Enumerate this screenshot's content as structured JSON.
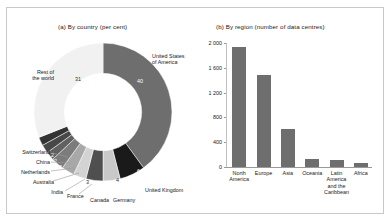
{
  "figure": {
    "background": "#ffffff",
    "border_color": "#c8c8c8"
  },
  "chart_data": [
    {
      "type": "pie",
      "title": "(a) By country (per cent)",
      "unit": "per cent",
      "hole_ratio": 0.56,
      "labels": [
        "United States of America",
        "United Kingdom",
        "Germany",
        "Canada",
        "France",
        "India",
        "Australia",
        "Netherlands",
        "China",
        "Switzerland",
        "Rest of the world"
      ],
      "values": [
        40,
        6,
        4,
        4,
        3,
        3,
        3,
        2,
        2,
        2,
        31
      ],
      "value_labels": [
        "40",
        "6",
        "4",
        "4",
        "3",
        "3",
        "3",
        "2",
        "2",
        "2",
        "31"
      ],
      "colors": [
        "#6e6e6e",
        "#1a1a1a",
        "#c9c9c9",
        "#4f4f4f",
        "#d3d3d3",
        "#a8a8a8",
        "#7c7c7c",
        "#616161",
        "#474747",
        "#333333",
        "#f1f1f1"
      ],
      "legend": "none",
      "grid": false
    },
    {
      "type": "bar",
      "title": "(b) By region (number of data centres)",
      "categories": [
        "North America",
        "Europe",
        "Asia",
        "Oceania",
        "Latin America and the Caribbean",
        "Africa"
      ],
      "category_lines": [
        [
          "North",
          "America"
        ],
        [
          "Europe"
        ],
        [
          "Asia"
        ],
        [
          "Oceania"
        ],
        [
          "Latin",
          "America",
          "and the",
          "Caribbean"
        ],
        [
          "Africa"
        ]
      ],
      "values": [
        1930,
        1490,
        620,
        130,
        110,
        60
      ],
      "xlabel": "",
      "ylabel": "",
      "ylim": [
        0,
        2000
      ],
      "yticks": [
        0,
        400,
        800,
        1200,
        1600,
        2000
      ],
      "ytick_labels": [
        "0",
        "400",
        "800",
        "1 200",
        "1 600",
        "2 000"
      ],
      "bar_color": "#6e6e6e",
      "grid": false,
      "legend": "none"
    }
  ],
  "panel_a": {
    "title": "(a) By country (per cent)",
    "segments": [
      {
        "name": "United States of America",
        "value": "40",
        "label_lines": [
          "United States",
          "of America"
        ]
      },
      {
        "name": "United Kingdom",
        "value": "6",
        "label_lines": [
          "United Kingdom"
        ]
      },
      {
        "name": "Germany",
        "value": "4",
        "label_lines": [
          "Germany"
        ]
      },
      {
        "name": "Canada",
        "value": "4",
        "label_lines": [
          "Canada"
        ]
      },
      {
        "name": "France",
        "value": "3",
        "label_lines": [
          "France"
        ]
      },
      {
        "name": "India",
        "value": "3",
        "label_lines": [
          "India"
        ]
      },
      {
        "name": "Australia",
        "value": "3",
        "label_lines": [
          "Australia"
        ]
      },
      {
        "name": "Netherlands",
        "value": "2",
        "label_lines": [
          "Netherlands"
        ]
      },
      {
        "name": "China",
        "value": "2",
        "label_lines": [
          "China"
        ]
      },
      {
        "name": "Switzerland",
        "value": "2",
        "label_lines": [
          "Switzerland"
        ]
      },
      {
        "name": "Rest of the world",
        "value": "31",
        "label_lines": [
          "Rest of",
          "the world"
        ]
      }
    ],
    "labels": {
      "usa_1": "United States",
      "usa_2": "of America",
      "usa_val": "40",
      "uk": "United Kingdom",
      "uk_val": "6",
      "germany": "Germany",
      "germany_val": "4",
      "canada": "Canada",
      "canada_val": "4",
      "france": "France",
      "france_val": "3",
      "india": "India",
      "india_val": "3",
      "australia": "Australia",
      "australia_val": "3",
      "netherlands": "Netherlands",
      "netherlands_val": "2",
      "china": "China",
      "china_val": "2",
      "switzerland": "Switzerland",
      "switzerland_val": "2",
      "rest_1": "Rest of",
      "rest_2": "the world",
      "rest_val": "31"
    }
  },
  "panel_b": {
    "title": "(b) By region (number of data centres)",
    "yticks": [
      "2 000",
      "1 600",
      "1 200",
      "800",
      "400",
      "0"
    ],
    "bars": [
      {
        "name": "North America",
        "value": 1930,
        "lines": [
          "North",
          "America"
        ]
      },
      {
        "name": "Europe",
        "value": 1490,
        "lines": [
          "Europe"
        ]
      },
      {
        "name": "Asia",
        "value": 620,
        "lines": [
          "Asia"
        ]
      },
      {
        "name": "Oceania",
        "value": 130,
        "lines": [
          "Oceania"
        ]
      },
      {
        "name": "Latin America and the Caribbean",
        "value": 110,
        "lines": [
          "Latin",
          "America",
          "and the",
          "Caribbean"
        ]
      },
      {
        "name": "Africa",
        "value": 60,
        "lines": [
          "Africa"
        ]
      }
    ]
  }
}
